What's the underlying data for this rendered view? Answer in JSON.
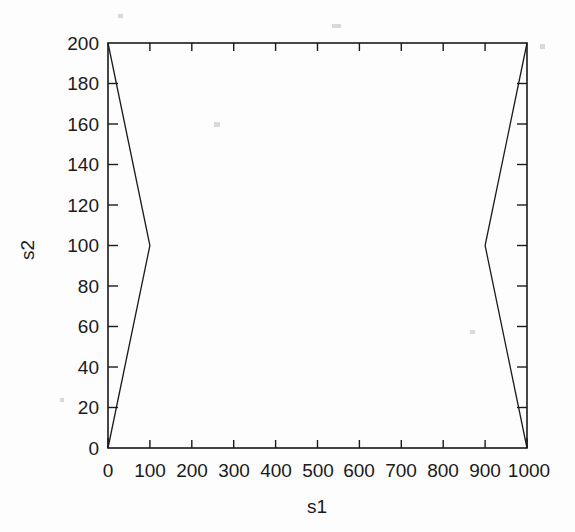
{
  "chart_data": {
    "type": "line",
    "title": "",
    "subtitle": "",
    "xlabel": "s1",
    "ylabel": "s2",
    "xlim": [
      0,
      1000
    ],
    "ylim": [
      0,
      200
    ],
    "xticks": [
      0,
      100,
      200,
      300,
      400,
      500,
      600,
      700,
      800,
      900,
      1000
    ],
    "yticks": [
      0,
      20,
      40,
      60,
      80,
      100,
      120,
      140,
      160,
      180,
      200
    ],
    "xtick_labels": [
      "0",
      "100",
      "200",
      "300",
      "400",
      "500",
      "600",
      "700",
      "800",
      "900",
      "1000"
    ],
    "ytick_labels": [
      "0",
      "20",
      "40",
      "60",
      "80",
      "100",
      "120",
      "140",
      "160",
      "180",
      "200"
    ],
    "grid": false,
    "legend": false,
    "legend_position": "none",
    "line_color": "#1a1a1a",
    "background_color": "#ffffff",
    "frame": "box",
    "tick_direction": "in",
    "series": [
      {
        "name": "left-branch",
        "x": [
          0,
          100,
          0
        ],
        "y": [
          200,
          100,
          0
        ]
      },
      {
        "name": "right-branch",
        "x": [
          1000,
          900,
          1000
        ],
        "y": [
          200,
          100,
          0
        ]
      }
    ]
  },
  "axes": {
    "x_title": "s1",
    "y_title": "s2"
  }
}
